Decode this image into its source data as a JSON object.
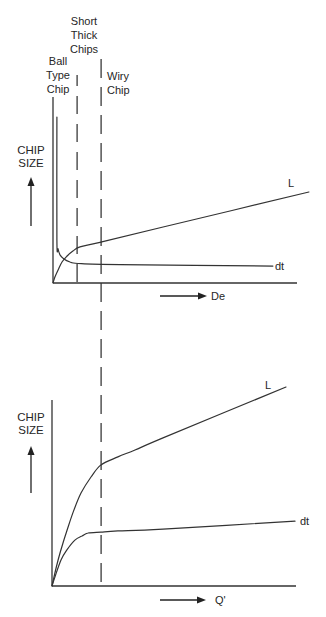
{
  "labels": {
    "ball_type_chip": [
      "Ball",
      "Type",
      "Chip"
    ],
    "short_thick_chips": [
      "Short",
      "Thick",
      "Chips"
    ],
    "wiry_chip": [
      "Wiry",
      "Chip"
    ],
    "top_chart": {
      "ylabel": [
        "CHIP",
        "SIZE"
      ],
      "xlabel": "De",
      "series_L": "L",
      "series_dt": "dt"
    },
    "bottom_chart": {
      "ylabel": [
        "CHIP",
        "SIZE"
      ],
      "xlabel": "Q'",
      "series_L": "L",
      "series_dt": "dt"
    }
  },
  "colors": {
    "line": "#333333",
    "text": "#262626",
    "background": "#ffffff"
  },
  "chart_data": [
    {
      "type": "line",
      "title": "",
      "xlabel": "De",
      "ylabel": "CHIP SIZE",
      "xlim": [
        0,
        1
      ],
      "ylim": [
        0,
        1
      ],
      "grid": false,
      "legend": "inline labels at line ends",
      "regions": [
        {
          "label": "Ball Type Chip",
          "x_start": 0.0,
          "x_end": 0.099
        },
        {
          "label": "Short Thick Chips",
          "x_start": 0.099,
          "x_end": 0.198
        },
        {
          "label": "Wiry Chip",
          "x_start": 0.198,
          "x_end": 1.0
        }
      ],
      "boundaries": [
        0.099,
        0.198
      ],
      "series": [
        {
          "name": "L",
          "points": [
            [
              0,
              0
            ],
            [
              0.008,
              0.032
            ],
            [
              0.021,
              0.07
            ],
            [
              0.037,
              0.113
            ],
            [
              0.058,
              0.145
            ],
            [
              0.082,
              0.172
            ],
            [
              0.111,
              0.194
            ],
            [
              0.198,
              0.22
            ],
            [
              0.453,
              0.301
            ],
            [
              1.053,
              0.489
            ]
          ]
        },
        {
          "name": "dt",
          "points": [
            [
              0.016,
              0.892
            ],
            [
              0.016,
              0.231
            ],
            [
              0.021,
              0.183
            ],
            [
              0.029,
              0.151
            ],
            [
              0.045,
              0.129
            ],
            [
              0.07,
              0.113
            ],
            [
              0.103,
              0.105
            ],
            [
              0.276,
              0.099
            ],
            [
              0.905,
              0.091
            ]
          ]
        }
      ]
    },
    {
      "type": "line",
      "title": "",
      "xlabel": "Q'",
      "ylabel": "CHIP SIZE",
      "xlim": [
        0,
        1
      ],
      "ylim": [
        0,
        1
      ],
      "grid": false,
      "legend": "inline labels at line ends",
      "boundaries": [
        0.201
      ],
      "series": [
        {
          "name": "L",
          "points": [
            [
              0,
              0
            ],
            [
              0.012,
              0.07
            ],
            [
              0.025,
              0.14
            ],
            [
              0.045,
              0.231
            ],
            [
              0.066,
              0.317
            ],
            [
              0.09,
              0.409
            ],
            [
              0.119,
              0.5
            ],
            [
              0.16,
              0.586
            ],
            [
              0.201,
              0.651
            ],
            [
              0.27,
              0.694
            ],
            [
              0.34,
              0.731
            ],
            [
              0.455,
              0.796
            ],
            [
              0.959,
              1.07
            ]
          ]
        },
        {
          "name": "dt",
          "points": [
            [
              0,
              0
            ],
            [
              0.012,
              0.048
            ],
            [
              0.037,
              0.14
            ],
            [
              0.061,
              0.194
            ],
            [
              0.094,
              0.247
            ],
            [
              0.123,
              0.269
            ],
            [
              0.148,
              0.285
            ],
            [
              0.201,
              0.29
            ],
            [
              0.27,
              0.296
            ],
            [
              0.455,
              0.306
            ],
            [
              0.996,
              0.349
            ]
          ]
        }
      ]
    }
  ]
}
